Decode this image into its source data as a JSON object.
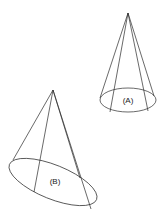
{
  "diagram": {
    "title": "",
    "colors": {
      "line": "#2a2a2a",
      "text": "#222222",
      "background": "#ffffff"
    },
    "cones": [
      {
        "id": "A",
        "label": "(A)",
        "apex": [
          128,
          13
        ],
        "base": {
          "cx": 128,
          "cy": 100,
          "rx": 29,
          "ry": 12,
          "rotate": 0
        },
        "generators": [
          [
            100,
            98
          ],
          [
            110,
            112
          ],
          [
            148,
            111
          ],
          [
            156,
            98
          ]
        ]
      },
      {
        "id": "B",
        "label": "(B)",
        "apex": [
          53,
          90
        ],
        "base": {
          "cx": 53,
          "cy": 181,
          "rx": 47,
          "ry": 17,
          "rotate": 22
        },
        "generators": [
          [
            14,
            158
          ],
          [
            34,
            192
          ],
          [
            82,
            183
          ],
          [
            92,
            210
          ]
        ]
      }
    ]
  }
}
